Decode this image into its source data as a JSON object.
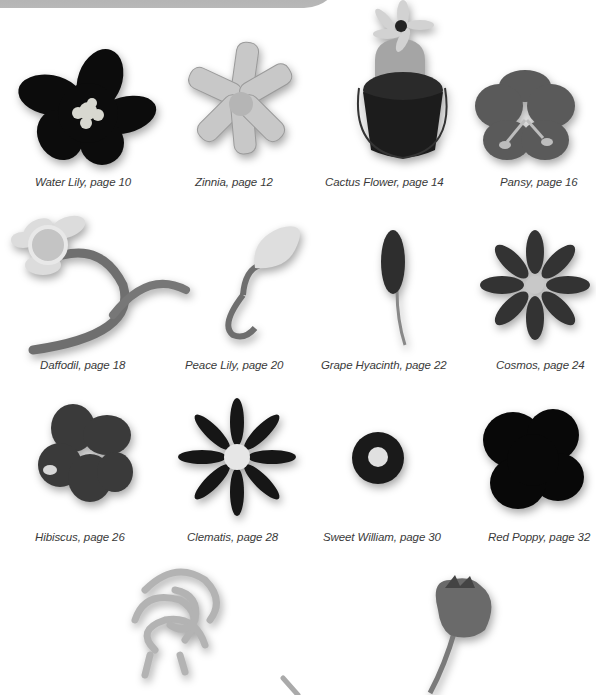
{
  "page": {
    "background": "#ffffff",
    "banner_color": "#b0b0b0"
  },
  "flowers": [
    {
      "name": "Water Lily",
      "page": "10",
      "caption": "Water Lily, page 10",
      "icon": "water-lily-image"
    },
    {
      "name": "Zinnia",
      "page": "12",
      "caption": "Zinnia, page 12",
      "icon": "zinnia-image"
    },
    {
      "name": "Cactus Flower",
      "page": "14",
      "caption": "Cactus Flower, page 14",
      "icon": "cactus-flower-image"
    },
    {
      "name": "Pansy",
      "page": "16",
      "caption": "Pansy, page 16",
      "icon": "pansy-image"
    },
    {
      "name": "Daffodil",
      "page": "18",
      "caption": "Daffodil, page 18",
      "icon": "daffodil-image"
    },
    {
      "name": "Peace Lily",
      "page": "20",
      "caption": "Peace Lily, page 20",
      "icon": "peace-lily-image"
    },
    {
      "name": "Grape Hyacinth",
      "page": "22",
      "caption": "Grape Hyacinth, page 22",
      "icon": "grape-hyacinth-image"
    },
    {
      "name": "Cosmos",
      "page": "24",
      "caption": "Cosmos, page 24",
      "icon": "cosmos-image"
    },
    {
      "name": "Hibiscus",
      "page": "26",
      "caption": "Hibiscus, page 26",
      "icon": "hibiscus-image"
    },
    {
      "name": "Clematis",
      "page": "28",
      "caption": "Clematis, page 28",
      "icon": "clematis-image"
    },
    {
      "name": "Sweet William",
      "page": "30",
      "caption": "Sweet William,  page 30",
      "icon": "sweet-william-image"
    },
    {
      "name": "Red Poppy",
      "page": "32",
      "caption": "Red Poppy, page 32",
      "icon": "red-poppy-image"
    },
    {
      "name": "Chrysanthemum (partial)",
      "caption": "",
      "icon": "curly-flower-image"
    },
    {
      "name": "Tulip bud (partial)",
      "caption": "",
      "icon": "tulip-bud-image"
    }
  ]
}
